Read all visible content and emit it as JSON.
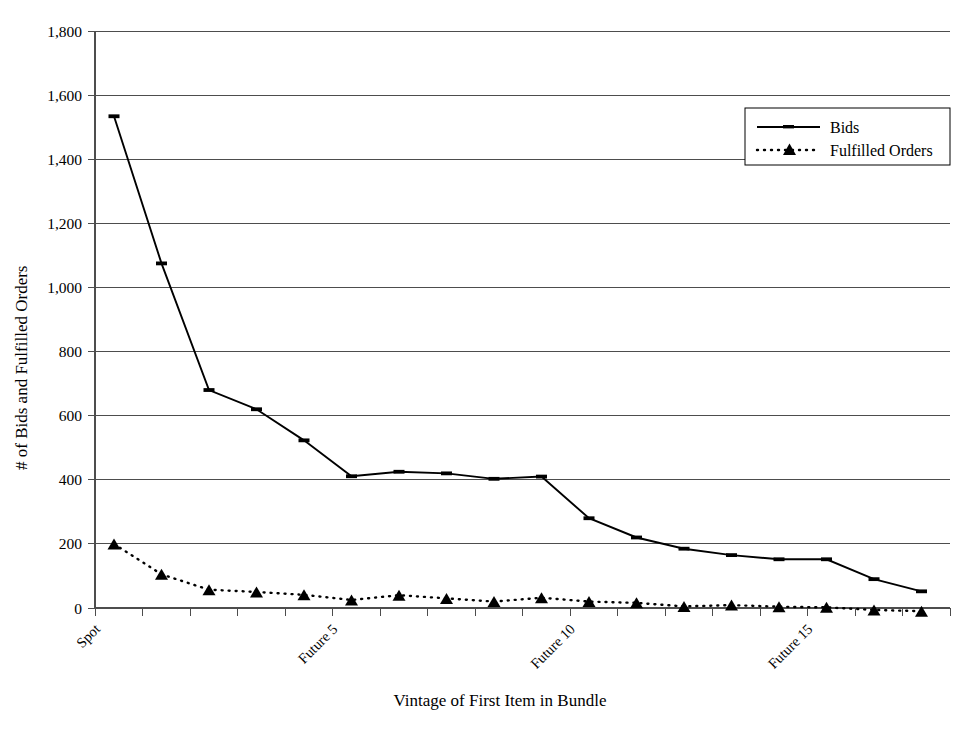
{
  "chart_data": {
    "type": "line",
    "title": "",
    "xlabel": "Vintage of First Item in Bundle",
    "ylabel": "# of Bids and Fulfilled Orders",
    "ylim": [
      0,
      1800
    ],
    "ytick_values": [
      0,
      200,
      400,
      600,
      800,
      1000,
      1200,
      1400,
      1600,
      1800
    ],
    "ytick_labels": [
      "0",
      "200",
      "400",
      "600",
      "800",
      "1,000",
      "1,200",
      "1,400",
      "1,600",
      "1,800"
    ],
    "grid": true,
    "legend_position": "upper right",
    "x_index": [
      0,
      1,
      2,
      3,
      4,
      5,
      6,
      7,
      8,
      9,
      10,
      11,
      12,
      13,
      14,
      15,
      16,
      17
    ],
    "xtick_labeled": [
      {
        "index": 0,
        "label": "Spot"
      },
      {
        "index": 5,
        "label": "Future 5"
      },
      {
        "index": 10,
        "label": "Future 10"
      },
      {
        "index": 15,
        "label": "Future 15"
      }
    ],
    "xtick_label_rotation": 45,
    "series": [
      {
        "name": "Bids",
        "marker": "dash",
        "linestyle": "solid",
        "values": [
          1534,
          1075,
          680,
          620,
          523,
          411,
          425,
          420,
          403,
          410,
          280,
          220,
          185,
          165,
          152,
          152,
          90,
          52
        ]
      },
      {
        "name": "Fulfilled Orders",
        "marker": "triangle",
        "linestyle": "dotted",
        "values": [
          200,
          105,
          57,
          50,
          41,
          25,
          40,
          30,
          20,
          32,
          20,
          16,
          5,
          9,
          4,
          2,
          -6,
          -10
        ]
      }
    ]
  },
  "legend": {
    "entries": [
      {
        "label": "Bids"
      },
      {
        "label": "Fulfilled Orders"
      }
    ]
  }
}
